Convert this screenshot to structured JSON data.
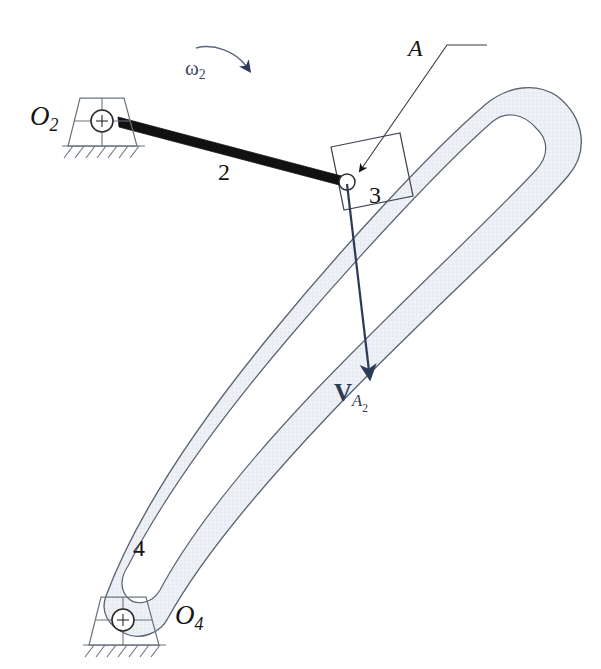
{
  "figure": {
    "type": "kinematic-diagram",
    "background_color": "#ffffff"
  },
  "colors": {
    "link2_black": "#111111",
    "outline_gray": "#5a6472",
    "body_fill": "#eef1f6",
    "slot_fill": "#ffffff",
    "vector_navy": "#2c3a56",
    "ground_gray": "#6b7480",
    "label_black": "#141414"
  },
  "labels": {
    "pivot_o2": {
      "base": "O",
      "sub": "2",
      "x": 30,
      "y": 103,
      "size": 27
    },
    "pivot_o4": {
      "base": "O",
      "sub": "4",
      "x": 175,
      "y": 602,
      "size": 27
    },
    "omega2": {
      "base": "ω",
      "sub": "2",
      "x": 185,
      "y": 58,
      "size": 21
    },
    "point_a": {
      "text": "A",
      "x": 408,
      "y": 36,
      "size": 24
    },
    "link2": {
      "text": "2",
      "x": 218,
      "y": 160,
      "size": 24
    },
    "link3": {
      "text": "3",
      "x": 369,
      "y": 183,
      "size": 24
    },
    "link4": {
      "text": "4",
      "x": 133,
      "y": 536,
      "size": 24
    },
    "velocity_a2": {
      "base": "V",
      "sub_a": "A",
      "sub_2": "2",
      "x": 334,
      "y": 380,
      "size": 25
    }
  },
  "geometry": {
    "o2_pin": {
      "x": 102,
      "y": 121
    },
    "o4_pin": {
      "x": 123,
      "y": 620
    },
    "point_a": {
      "x": 347,
      "y": 182
    },
    "velocity_tip": {
      "x": 369,
      "y": 375
    },
    "link2_from": {
      "x": 120,
      "y": 122
    },
    "link2_to": {
      "x": 347,
      "y": 182
    },
    "omega_arc_start": {
      "x": 196,
      "y": 47
    },
    "omega_arc_end": {
      "x": 245,
      "y": 69
    },
    "leader_a_corner": {
      "x": 487,
      "y": 45
    },
    "leader_a_tip": {
      "x": 361,
      "y": 172
    }
  },
  "annotations": {
    "o2_ground": "fixed-pivot-ground-o2",
    "o4_ground": "fixed-pivot-ground-o4",
    "slot": "curved-slot",
    "slider": "slider-block-3",
    "rocker": "curved-rocker-link-4",
    "crank": "crank-link-2"
  }
}
